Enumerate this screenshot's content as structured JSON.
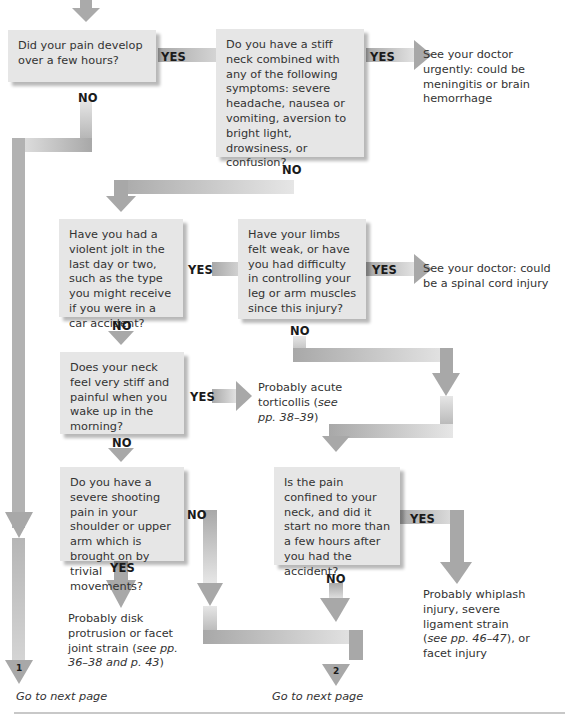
{
  "flowchart": {
    "questions": [
      {
        "id": "q1",
        "text": "Did your pain develop over a few hours?"
      },
      {
        "id": "q2",
        "text": "Do you have a stiff neck combined with any of the following symptoms: severe headache, nausea or vomiting, aversion to bright light, drowsiness, or confusion?"
      },
      {
        "id": "q3",
        "text": "Have you had a violent jolt in the last day or two, such as the type you might receive if you were in a car accident?"
      },
      {
        "id": "q4",
        "text": "Have your limbs felt weak, or have you had difficulty in controlling your leg or arm muscles since this injury?"
      },
      {
        "id": "q5",
        "text": "Does your neck feel very stiff and painful when you wake up in the morning?"
      },
      {
        "id": "q6",
        "text": "Do you have a severe shooting pain in your shoulder or upper arm which is brought on by trivial movements?"
      },
      {
        "id": "q7",
        "text": "Is the pain confined to your neck, and did it start no more than a few hours after you had the accident?"
      }
    ],
    "outcomes": [
      {
        "id": "o1",
        "text": "See your doctor urgently: could be meningitis or brain hemorrhage"
      },
      {
        "id": "o2",
        "text": "See your doctor: could be a spinal cord injury"
      },
      {
        "id": "o3",
        "text": "Probably acute torticollis (",
        "ref": "see pp. 38–39",
        "tail": ")"
      },
      {
        "id": "o4",
        "text": "Probably disk protrusion or facet joint strain (",
        "ref": "see pp. 36–38 and p. 43",
        "tail": ")"
      },
      {
        "id": "o5",
        "text": "Probably whiplash injury, severe ligament strain (",
        "ref": "see pp. 46–47",
        "tail": "), or facet injury"
      }
    ],
    "labels": {
      "yes": "YES",
      "no": "NO"
    },
    "continuations": [
      {
        "number": "1",
        "text": "Go to next page"
      },
      {
        "number": "2",
        "text": "Go to next page"
      }
    ],
    "colors": {
      "box": "#e6e6e6",
      "arrow": "#a9a9a9",
      "arrow_light": "#e9e9e9",
      "text": "#333333",
      "label": "#1a1a1a"
    }
  }
}
